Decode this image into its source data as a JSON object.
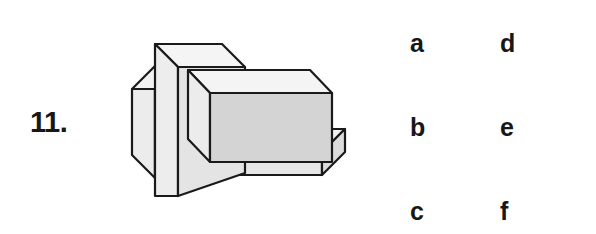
{
  "question": {
    "number": "11.",
    "figure_name": "isometric-solid-block-figure"
  },
  "choices": {
    "rows": [
      {
        "left": "a",
        "right": "d"
      },
      {
        "left": "b",
        "right": "e"
      },
      {
        "left": "c",
        "right": "f"
      }
    ]
  },
  "figure": {
    "colors": {
      "outline": "#1a1a1a",
      "face_top": "#f2f2f2",
      "face_front_light": "#ebebeb",
      "face_front_dark": "#d6d6d6",
      "face_side": "#e3e3e3",
      "background": "#ffffff"
    }
  }
}
